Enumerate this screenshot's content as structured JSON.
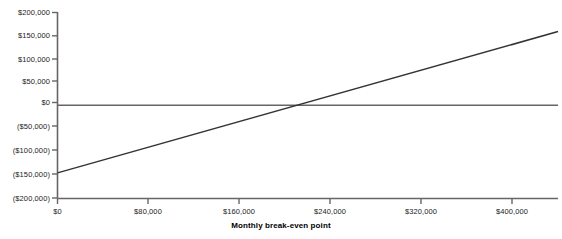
{
  "chart_data": {
    "type": "line",
    "title": "",
    "xlabel": "Monthly break-even point",
    "ylabel": "",
    "xlim": [
      0,
      440000
    ],
    "ylim": [
      -200000,
      200000
    ],
    "grid": false,
    "legend": false,
    "x_ticks": [
      {
        "value": 0,
        "label": "$0"
      },
      {
        "value": 80000,
        "label": "$80,000"
      },
      {
        "value": 160000,
        "label": "$160,000"
      },
      {
        "value": 240000,
        "label": "$240,000"
      },
      {
        "value": 320000,
        "label": "$320,000"
      },
      {
        "value": 400000,
        "label": "$400,000"
      }
    ],
    "y_ticks": [
      {
        "value": 200000,
        "label": "$200,000"
      },
      {
        "value": 150000,
        "label": "$150,000"
      },
      {
        "value": 100000,
        "label": "$100,000"
      },
      {
        "value": 50000,
        "label": "$50,000"
      },
      {
        "value": 0,
        "label": "$0"
      },
      {
        "value": -50000,
        "label": "($50,000)"
      },
      {
        "value": -100000,
        "label": "($100,000)"
      },
      {
        "value": -150000,
        "label": "($150,000)"
      },
      {
        "value": -200000,
        "label": "($200,000)"
      }
    ],
    "series": [
      {
        "name": "Profit",
        "color": "#333333",
        "points": [
          {
            "x": 0,
            "y": -145000
          },
          {
            "x": 440000,
            "y": 158000
          }
        ]
      }
    ],
    "reference_lines": [
      {
        "name": "zero-line",
        "axis": "y",
        "value": 0,
        "color": "#666666"
      }
    ],
    "break_even_x": 210000,
    "axis_color": "#666666"
  }
}
